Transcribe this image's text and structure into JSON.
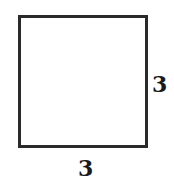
{
  "diagram": {
    "shape": "square",
    "labels": {
      "right_side": "3",
      "bottom_side": "3"
    },
    "colors": {
      "stroke": "#2a2a2a",
      "fill": "#ffffff",
      "text": "#1a1a1a"
    }
  }
}
